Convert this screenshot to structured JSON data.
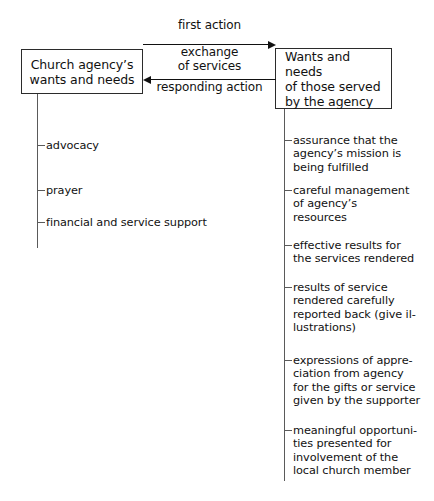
{
  "diagram": {
    "background_color": "#ffffff",
    "line_color": "#2b2b2b",
    "text_color": "#111111",
    "left_node": {
      "label": "Church agency’s\nwants and needs"
    },
    "right_node": {
      "label": "Wants and needs\nof those served\nby the agency"
    },
    "arrows": {
      "top_label": "first action",
      "middle_label": "exchange\nof services",
      "bottom_label": "responding action",
      "top_direction": "right",
      "bottom_direction": "left"
    },
    "left_branches": [
      {
        "label": "advocacy",
        "y": 139
      },
      {
        "label": "prayer",
        "y": 184
      },
      {
        "label": "financial and service support",
        "y": 216
      }
    ],
    "right_branches": [
      {
        "label": "assurance that the\nagency’s mission is\nbeing fulfilled",
        "y": 134
      },
      {
        "label": "careful management\nof agency’s\nresources",
        "y": 184
      },
      {
        "label": "effective results for\nthe services rendered",
        "y": 239
      },
      {
        "label": "results of service\nrendered carefully\nreported back (give il-\nlustrations)",
        "y": 281
      },
      {
        "label": "expressions of appre-\nciation from agency\nfor the gifts or service\ngiven by the supporter",
        "y": 354
      },
      {
        "label": "meaningful opportuni-\nties presented for\ninvolvement of the\nlocal church member",
        "y": 424
      }
    ]
  }
}
